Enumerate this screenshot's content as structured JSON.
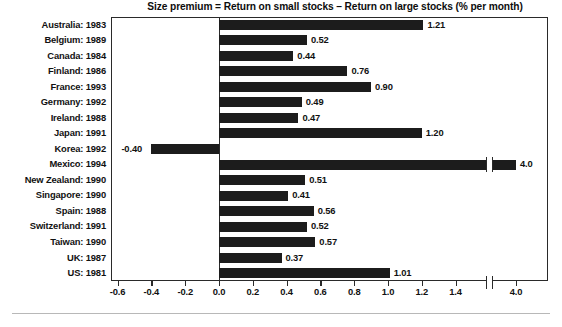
{
  "chart_data": {
    "type": "bar",
    "orientation": "horizontal",
    "title": "Size premium = Return on small stocks – Return on large stocks (% per month)",
    "xlabel": "",
    "ylabel": "",
    "grid": false,
    "legend": null,
    "axis_break": {
      "present": true,
      "between": [
        1.5,
        3.5
      ],
      "note": "scale break between 1.4 and 4.0"
    },
    "xlim": [
      -0.6,
      4.0
    ],
    "xticks": [
      {
        "label": "-0.6",
        "value": -0.6
      },
      {
        "label": "-0.4",
        "value": -0.4
      },
      {
        "label": "-0.2",
        "value": -0.2
      },
      {
        "label": "0.0",
        "value": 0.0
      },
      {
        "label": "0.2",
        "value": 0.2
      },
      {
        "label": "0.4",
        "value": 0.4
      },
      {
        "label": "0.6",
        "value": 0.6
      },
      {
        "label": "0.8",
        "value": 0.8
      },
      {
        "label": "1.0",
        "value": 1.0
      },
      {
        "label": "1.2",
        "value": 1.2
      },
      {
        "label": "1.4",
        "value": 1.4
      },
      {
        "label": "4.0",
        "value": 4.0
      }
    ],
    "categories": [
      "Australia: 1983",
      "Belgium: 1989",
      "Canada: 1984",
      "Finland: 1986",
      "France: 1993",
      "Germany: 1992",
      "Ireland: 1988",
      "Japan: 1991",
      "Korea: 1992",
      "Mexico: 1994",
      "New Zealand: 1990",
      "Singapore: 1990",
      "Spain: 1988",
      "Switzerland: 1991",
      "Taiwan: 1990",
      "UK: 1987",
      "US: 1981"
    ],
    "values": [
      1.21,
      0.52,
      0.44,
      0.76,
      0.9,
      0.49,
      0.47,
      1.2,
      -0.4,
      4.0,
      0.51,
      0.41,
      0.56,
      0.52,
      0.57,
      0.37,
      1.01
    ],
    "value_labels": [
      "1.21",
      "0.52",
      "0.44",
      "0.76",
      "0.90",
      "0.49",
      "0.47",
      "1.20",
      "-0.40",
      "4.0",
      "0.51",
      "0.41",
      "0.56",
      "0.52",
      "0.57",
      "0.37",
      "1.01"
    ],
    "bar_color": "#1c1c1c",
    "frame_color": "#2a2a2a",
    "background": "#ffffff"
  }
}
